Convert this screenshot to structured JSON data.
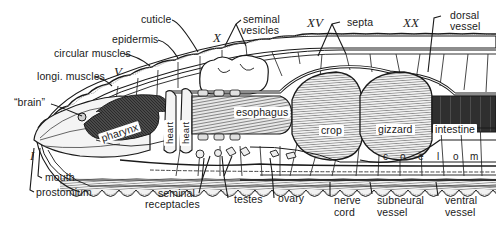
{
  "diagram": {
    "segment_markers": [
      "I",
      "V",
      "X",
      "XV",
      "XX"
    ],
    "labels_top": {
      "cuticle": "cuticle",
      "epidermis": "epidermis",
      "circular_muscles": "circular muscles",
      "longi_muscles": "longi. muscles",
      "brain": "“brain”",
      "seminal_vesicles_1": "seminal",
      "seminal_vesicles_2": "vesicles",
      "septa": "septa",
      "dorsal_vessel_1": "dorsal",
      "dorsal_vessel_2": "vessel"
    },
    "labels_inner": {
      "pharynx": "pharynx",
      "heart_1": "heart",
      "heart_2": "heart",
      "esophagus": "esophagus",
      "crop": "crop",
      "gizzard": "gizzard",
      "intestine": "intestine"
    },
    "coelom_letters": [
      "c",
      "o",
      "e",
      "l",
      "o",
      "m"
    ],
    "labels_bottom": {
      "mouth": "mouth",
      "prostomium": "prostomium",
      "seminal_receptacles_1": "seminal",
      "seminal_receptacles_2": "receptacles",
      "testes": "testes",
      "ovary": "ovary",
      "nerve_cord_1": "nerve",
      "nerve_cord_2": "cord",
      "subneural_vessel_1": "subneural",
      "subneural_vessel_2": "vessel",
      "ventral_vessel_1": "ventral",
      "ventral_vessel_2": "vessel"
    },
    "colors": {
      "ink": "#1a1a1a",
      "tissue_dark": "#3a3a3a",
      "tissue_mid": "#8a8a8a",
      "tissue_light": "#d8d8d8",
      "background": "#ffffff"
    }
  }
}
